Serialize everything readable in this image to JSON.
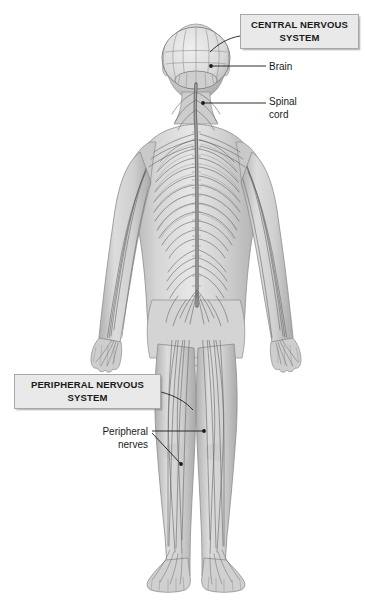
{
  "figure": {
    "title": "Nervous System",
    "view": "posterior view of human body with nervous system overlay",
    "background_color": "#ffffff",
    "body_fill": "#d8d8d8",
    "nerve_color": "#5f5f5f",
    "text_color": "#1a1a1a"
  },
  "callouts": {
    "cns": {
      "label": "CENTRAL NERVOUS\nSYSTEM",
      "line1": "CENTRAL NERVOUS",
      "line2": "SYSTEM",
      "box_fill": "#e9e9e9",
      "box_border": "#a8a8a8"
    },
    "pns": {
      "label": "PERIPHERAL NERVOUS\nSYSTEM",
      "line1": "PERIPHERAL NERVOUS",
      "line2": "SYSTEM",
      "box_fill": "#e9e9e9",
      "box_border": "#a8a8a8"
    }
  },
  "labels": {
    "brain": "Brain",
    "spinal_cord": "Spinal\ncord",
    "peripheral_nerves": "Peripheral\nnerves"
  },
  "structures": [
    {
      "name": "brain",
      "system": "central"
    },
    {
      "name": "spinal cord",
      "system": "central"
    },
    {
      "name": "peripheral nerves",
      "system": "peripheral"
    }
  ]
}
